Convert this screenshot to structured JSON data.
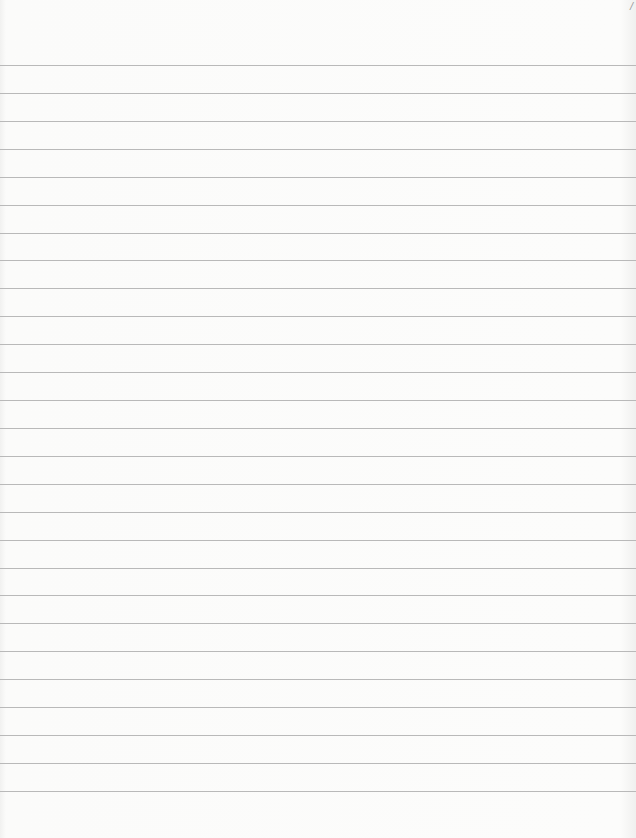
{
  "page": {
    "type": "blank lined paper",
    "corner_mark": "/",
    "rule_color": "#b9b9b9",
    "background": "#fbfbfa",
    "rules": {
      "first_y": 65,
      "spacing": 27.92,
      "count": 27
    }
  }
}
